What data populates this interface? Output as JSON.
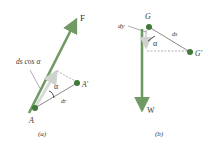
{
  "panel_a": {
    "caption": "(a)",
    "force_label": "F",
    "point_start_label": "A",
    "point_end_label": "A′",
    "displacement_label": "dr",
    "projection_label": "ds cos α",
    "angle_label": "α"
  },
  "panel_b": {
    "caption": "(b)",
    "force_label": "W",
    "point_start_label": "G",
    "point_end_label": "G′",
    "displacement_label": "ds",
    "vertical_label": "dy",
    "angle_label": "α"
  },
  "colors": {
    "force_arrow": "#6f9a63",
    "point": "#3f7a3a",
    "displacement": "#8a8a8a",
    "projection_arrow": "#d8dcd8",
    "dashed": "#9a9a9a",
    "text": "#3a3a3a"
  }
}
